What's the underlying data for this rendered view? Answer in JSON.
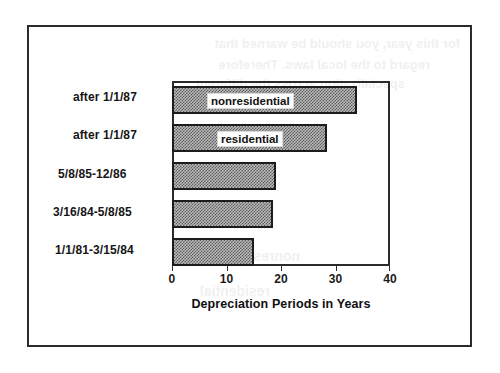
{
  "figure": {
    "border_color": "#2b2b2b",
    "background": "#ffffff"
  },
  "chart_data": {
    "type": "bar",
    "orientation": "horizontal",
    "title": "",
    "xlabel": "Depreciation Periods in Years",
    "ylabel": "",
    "xlim": [
      0,
      40
    ],
    "xticks": [
      0,
      10,
      20,
      30,
      40
    ],
    "xticklabels": [
      "0",
      "10",
      "20",
      "30",
      "40"
    ],
    "grid": false,
    "legend": "in-bar annotations",
    "categories": [
      "after 1/1/87",
      "after 1/1/87",
      "5/8/85-12/86",
      "3/16/84-5/8/85",
      "1/1/81-3/15/84"
    ],
    "values": [
      34,
      28.5,
      19,
      18.5,
      15
    ],
    "annotations": [
      {
        "index": 0,
        "text": "nonresidential"
      },
      {
        "index": 1,
        "text": "residential"
      }
    ],
    "bar_fill": "#8a8a8a",
    "bar_edge": "#1c1c1c"
  },
  "ghost_text": {
    "lines": [
      "for this year, you should be warned  that",
      "regard  to  the  local  laws.   Therefore",
      "specialization  across  the  different",
      "nonresidential",
      "residential"
    ]
  }
}
